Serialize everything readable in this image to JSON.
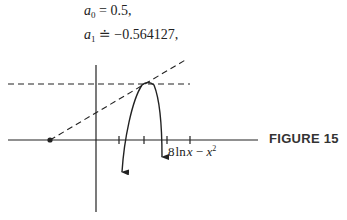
{
  "equations": [
    {
      "var": "a",
      "sub": "0",
      "rel": "=",
      "value": "0.5,"
    },
    {
      "var": "a",
      "sub": "1",
      "rel": "≐",
      "value": "−0.564127,"
    }
  ],
  "figure": {
    "label": "FIGURE 15",
    "curve_label": {
      "coef": "8",
      "fn": "ln",
      "x": "x",
      "minus": "−",
      "x2": "x",
      "exp": "2"
    },
    "axes": {
      "x_axis_y": 140,
      "y_axis_x": 96,
      "ticks_x": [
        119,
        144,
        167,
        190
      ]
    },
    "colors": {
      "ink": "#222222"
    }
  }
}
